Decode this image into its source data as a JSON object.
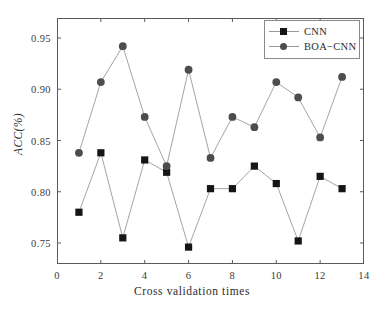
{
  "chart_data": {
    "type": "line",
    "title": "",
    "xlabel": "Cross validation times",
    "ylabel": "ACC(%)",
    "xlim": [
      0,
      14
    ],
    "ylim": [
      0.7295,
      0.9695
    ],
    "xticks": [
      "0",
      "2",
      "4",
      "6",
      "8",
      "10",
      "12",
      "14"
    ],
    "xtick_values": [
      0,
      2,
      4,
      6,
      8,
      10,
      12,
      14
    ],
    "yticks": [
      "0.75",
      "0.80",
      "0.85",
      "0.90",
      "0.95"
    ],
    "ytick_values": [
      0.75,
      0.8,
      0.85,
      0.9,
      0.95
    ],
    "grid": false,
    "legend_position": "top-right",
    "x": [
      1,
      2,
      3,
      4,
      5,
      6,
      7,
      8,
      9,
      10,
      11,
      12,
      13
    ],
    "series": [
      {
        "name": "CNN",
        "marker": "square",
        "marker_color": "#151515",
        "line_color": "#9a9a9a",
        "values": [
          0.78,
          0.838,
          0.755,
          0.831,
          0.819,
          0.746,
          0.803,
          0.803,
          0.825,
          0.808,
          0.752,
          0.815,
          0.803
        ]
      },
      {
        "name": "BOA-CNN",
        "marker": "circle",
        "marker_color": "#4d4d4d",
        "line_color": "#9a9a9a",
        "values": [
          0.838,
          0.907,
          0.942,
          0.873,
          0.825,
          0.919,
          0.833,
          0.873,
          0.863,
          0.907,
          0.892,
          0.853,
          0.912
        ]
      }
    ]
  },
  "legend": {
    "entries": [
      {
        "label": "CNN",
        "marker": "square-marker"
      },
      {
        "label": "BOA−CNN",
        "marker": "circle-marker"
      }
    ]
  },
  "colors": {
    "frame": "#5a5a5a",
    "line": "#9a9a9a",
    "cnn_marker": "#151515",
    "boa_marker": "#4d4d4d",
    "background": "#ffffff",
    "text": "#2b2b2b"
  }
}
